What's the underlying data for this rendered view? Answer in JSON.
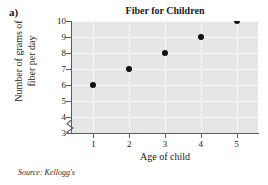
{
  "figure": {
    "part_label": "a)",
    "source_note": "Source: Kellogg's"
  },
  "chart_data": {
    "type": "scatter",
    "title": "Fiber for Children",
    "xlabel": "Age of child",
    "ylabel_line1": "Number of grams of",
    "ylabel_line2": "fiber per day",
    "x": [
      1,
      2,
      3,
      4,
      5
    ],
    "values": [
      6,
      7,
      8,
      9,
      10
    ],
    "points": [
      {
        "x": 1,
        "y": 6
      },
      {
        "x": 2,
        "y": 7
      },
      {
        "x": 3,
        "y": 8
      },
      {
        "x": 4,
        "y": 9
      },
      {
        "x": 5,
        "y": 10
      }
    ],
    "xticks": [
      "1",
      "2",
      "3",
      "4",
      "5"
    ],
    "yticks": [
      "10",
      "9",
      "8",
      "7",
      "6",
      "5",
      "4",
      "3"
    ],
    "xlim": [
      0.4,
      5.6
    ],
    "ylim": [
      3,
      10
    ],
    "y_axis_break": true,
    "grid": true,
    "legend": "none",
    "plot_background": "#e6e6e6",
    "gridline_color": "#f7f7f7",
    "marker_color": "#111111",
    "axis_color": "#5b5b5b"
  }
}
